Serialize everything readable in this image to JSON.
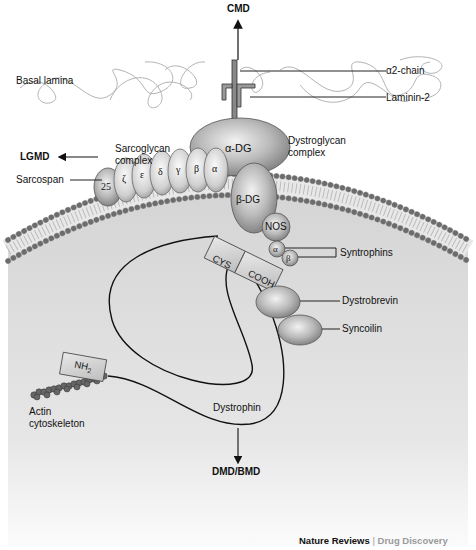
{
  "diagram": {
    "disease_links": {
      "top": "CMD",
      "left": "LGMD",
      "bottom": "DMD/BMD"
    },
    "labels": {
      "basal_lamina": "Basal lamina",
      "alpha2_chain": "α2-chain",
      "laminin2": "Laminin-2",
      "dystroglycan_line1": "Dystroglycan",
      "dystroglycan_line2": "complex",
      "sarcoglycan_line1": "Sarcoglycan",
      "sarcoglycan_line2": "complex",
      "sarcospan": "Sarcospan",
      "syntrophins": "Syntrophins",
      "dystrobrevin": "Dystrobrevin",
      "syncoilin": "Syncoilin",
      "actin_line1": "Actin",
      "actin_line2": "cytoskeleton",
      "dystrophin": "Dystrophin"
    },
    "proteins": {
      "alpha_dg": "α-DG",
      "beta_dg": "β-DG",
      "sarcospan_num": "25",
      "sarcoglycans": [
        "ζ",
        "ε",
        "δ",
        "γ",
        "β",
        "α"
      ],
      "nos": "NOS",
      "syntrophin_alpha": "α",
      "syntrophin_beta": "β",
      "cys_domain": "CYS",
      "cooh_domain": "COOH",
      "nh2_domain": "NH",
      "nh2_sub": "2"
    },
    "colors": {
      "cytoplasm": "#d9d9d9",
      "protein_fill": "#a8a8a8",
      "membrane_head": "#8a8a8a",
      "text": "#111111",
      "credit_gray": "#9a9a9a"
    }
  },
  "credit": {
    "publisher": "Nature Reviews",
    "separator": " | ",
    "journal": "Drug Discovery"
  }
}
